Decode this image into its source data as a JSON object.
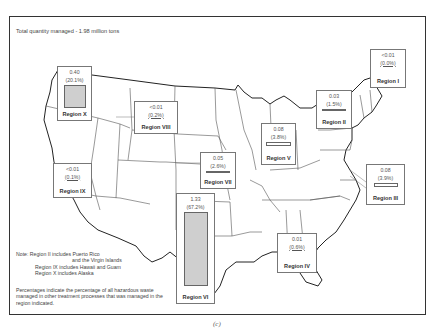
{
  "title": "Total quantity managed - 1.98 million tons",
  "caption": "(c)",
  "regions": [
    {
      "id": "X",
      "value": "0.40",
      "percent": "(20.1%)",
      "label": "Region X"
    },
    {
      "id": "VIII",
      "value": "<0.01",
      "percent": "(0.2%)",
      "label": "Region VIII"
    },
    {
      "id": "IX",
      "value": "<0.01",
      "percent": "(0.1%)",
      "label": "Region IX"
    },
    {
      "id": "VII",
      "value": "0.05",
      "percent": "(2.6%)",
      "label": "Region VII"
    },
    {
      "id": "VI",
      "value": "1.33",
      "percent": "(67.2%)",
      "label": "Region VI"
    },
    {
      "id": "V",
      "value": "0.08",
      "percent": "(3.8%)",
      "label": "Region V"
    },
    {
      "id": "II",
      "value": "0.03",
      "percent": "(1.5%)",
      "label": "Region II"
    },
    {
      "id": "I",
      "value": "<0.01",
      "percent": "(0.0%)",
      "label": "Region I"
    },
    {
      "id": "III",
      "value": "0.08",
      "percent": "(3.9%)",
      "label": "Region III"
    },
    {
      "id": "IV",
      "value": "0.01",
      "percent": "(0.6%)",
      "label": "Region IV"
    }
  ],
  "note": {
    "line1": "Note:  Region II includes Puerto Rico",
    "line2": "and the Virgin Islands",
    "line3": "Region IX includes Hawaii and Guam",
    "line4": "Region X includes Alaska",
    "percent_note": "Percentages indicate the percentage of all hazardous waste managed in other treatment processes that was managed in the region indicated."
  },
  "colors": {
    "bar_fill": "#cfcfcf",
    "border": "#333333"
  }
}
